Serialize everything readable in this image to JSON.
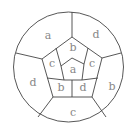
{
  "diagram": {
    "type": "map-coloring",
    "regions": {
      "outer_top_left": "a",
      "outer_top_right": "d",
      "outer_right": "b",
      "outer_bottom": "c",
      "outer_left": "d",
      "middle_top": "b",
      "middle_right": "c",
      "middle_bottom_right": "d",
      "middle_bottom_left": "b",
      "middle_left": "c",
      "center": "a"
    },
    "colors": {
      "stroke": "#444444",
      "label": "#888888",
      "background": "#ffffff"
    }
  }
}
